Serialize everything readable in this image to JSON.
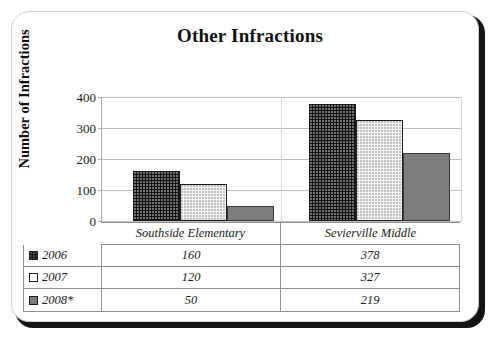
{
  "chart_data": {
    "type": "bar",
    "title": "Other Infractions",
    "xlabel": "",
    "ylabel": "Number of Infractions",
    "ylim": [
      0,
      400
    ],
    "yticks": [
      0,
      100,
      200,
      300,
      400
    ],
    "ytick_labels": [
      "0",
      "100",
      "200",
      "300",
      "400"
    ],
    "grid": true,
    "legend_position": "table-left",
    "categories": [
      "Southside Elementary",
      "Sevierville Middle"
    ],
    "series": [
      {
        "name": "2006",
        "values": [
          160,
          378
        ],
        "color": "#121212",
        "pattern": "dotted-dark"
      },
      {
        "name": "2007",
        "values": [
          120,
          327
        ],
        "color": "#f7f7f7",
        "pattern": "dotted-light"
      },
      {
        "name": "2008*",
        "values": [
          50,
          219
        ],
        "color": "#7d7d7d",
        "pattern": "solid-gray"
      }
    ],
    "table": {
      "row_labels": [
        "2006",
        "2007",
        "2008*"
      ],
      "column_headers": [
        "Southside Elementary",
        "Sevierville Middle"
      ],
      "cells": [
        [
          "160",
          "378"
        ],
        [
          "120",
          "327"
        ],
        [
          "50",
          "219"
        ]
      ]
    }
  }
}
